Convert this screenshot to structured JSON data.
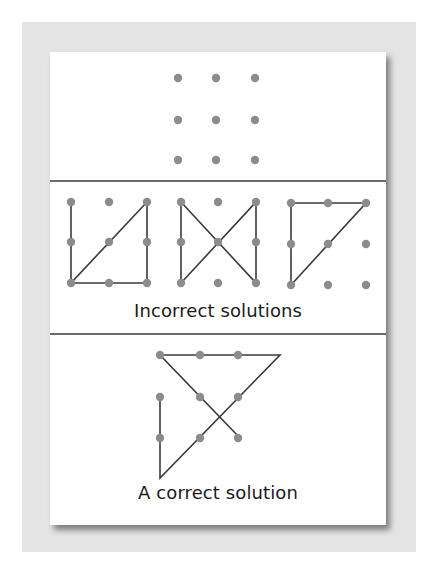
{
  "figure": {
    "labels": {
      "incorrect": "Incorrect solutions",
      "correct": "A correct solution"
    },
    "colors": {
      "mat": "#e4e4e4",
      "card": "#ffffff",
      "dot": "#8c8c8c",
      "line": "#3a3a3a",
      "divider": "#3a3a3a",
      "text": "#1a1a1a"
    },
    "puzzle_grid": {
      "columns": [
        178,
        216,
        255
      ],
      "rows": [
        78,
        120,
        160
      ]
    },
    "incorrect_panels": [
      {
        "columns": [
          71,
          109,
          147
        ],
        "rows": [
          202,
          242,
          283
        ],
        "path": [
          [
            147,
            202
          ],
          [
            71,
            283
          ],
          [
            147,
            283
          ],
          [
            147,
            202
          ]
        ],
        "extra_segments": [
          [
            [
              71,
              202
            ],
            [
              71,
              283
            ]
          ]
        ]
      },
      {
        "columns": [
          181,
          218,
          256
        ],
        "rows": [
          202,
          242,
          283
        ],
        "path": [
          [
            181,
            283
          ],
          [
            181,
            202
          ],
          [
            256,
            283
          ],
          [
            256,
            202
          ],
          [
            181,
            283
          ]
        ]
      },
      {
        "columns": [
          291,
          328,
          366
        ],
        "rows": [
          203,
          244,
          285
        ],
        "path": [
          [
            291,
            285
          ],
          [
            291,
            203
          ],
          [
            366,
            203
          ],
          [
            291,
            285
          ]
        ]
      }
    ],
    "correct_panel": {
      "columns": [
        160,
        200,
        238
      ],
      "rows": [
        355,
        397,
        438
      ],
      "path": [
        [
          160,
          397
        ],
        [
          160,
          478
        ],
        [
          280,
          355
        ],
        [
          160,
          355
        ],
        [
          240,
          438
        ]
      ]
    },
    "dividers": [
      181,
      334
    ]
  }
}
